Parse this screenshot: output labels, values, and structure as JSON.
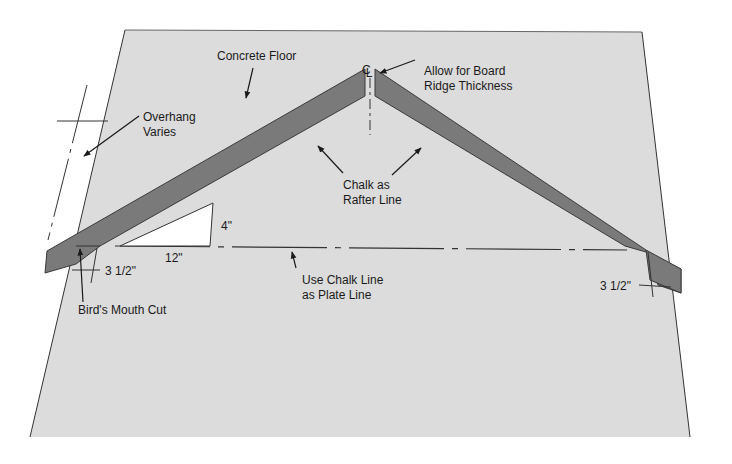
{
  "diagram": {
    "colors": {
      "floor_fill": "#dcdcdc",
      "floor_edge": "#444444",
      "rafter_fill": "#7a7a7a",
      "rafter_edge": "#3a3a3a",
      "line": "#2a2a2a",
      "text": "#1a1a1a",
      "background": "#ffffff"
    },
    "labels": {
      "concrete_floor": "Concrete Floor",
      "centerline": "CL",
      "allow_board_1": "Allow for Board",
      "allow_board_2": "Ridge Thickness",
      "overhang_1": "Overhang",
      "overhang_2": "Varies",
      "chalk_rafter_1": "Chalk as",
      "chalk_rafter_2": "Rafter Line",
      "rise": "4\"",
      "run": "12\"",
      "seat_left": "3 1/2\"",
      "seat_right": "3 1/2\"",
      "birds_mouth": "Bird's Mouth Cut",
      "plate_line_1": "Use Chalk Line",
      "plate_line_2": "as Plate Line"
    }
  }
}
